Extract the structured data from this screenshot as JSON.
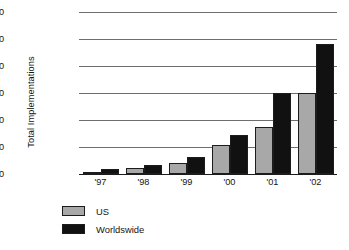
{
  "chart_data": {
    "type": "bar",
    "title": "",
    "subtitle": "",
    "xlabel": "",
    "ylabel": "Total Implementations",
    "categories": [
      "'97",
      "'98",
      "'99",
      "'00",
      "'01",
      "'02"
    ],
    "series": [
      {
        "name": "US",
        "color": "#a8a8a8",
        "values": [
          300,
          1100,
          2000,
          5300,
          8700,
          15000
        ]
      },
      {
        "name": "Worldswide",
        "color": "#111111",
        "values": [
          900,
          1600,
          3100,
          7300,
          15000,
          24000
        ]
      }
    ],
    "ylim": [
      0,
      30000
    ],
    "yticks": [
      0,
      5000,
      10000,
      15000,
      20000,
      25000,
      30000
    ],
    "ytick_labels": [
      "0",
      "5,000",
      "10,000",
      "15,000",
      "20,000",
      "25,000",
      "30,000"
    ],
    "grid": true,
    "legend_position": "bottom-left"
  },
  "legend": {
    "items": [
      {
        "label": "US",
        "swatch": "us"
      },
      {
        "label": "Worldswide",
        "swatch": "ww"
      }
    ]
  }
}
